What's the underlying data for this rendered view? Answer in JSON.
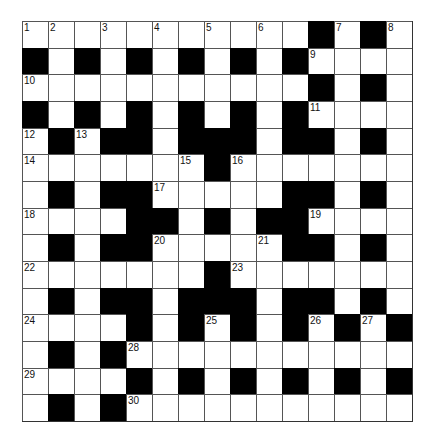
{
  "puzzle": {
    "rows": 15,
    "cols": 15,
    "colors": {
      "block": "#000000",
      "open": "#ffffff",
      "line": "#555555"
    },
    "layout": [
      ".....,.....B.B.",
      "B.B.B.B.B.B....",
      "...........B.B.",
      "B.B.B.B.B.B....",
      ".B.BB.BBB.BB.B.",
      ".......B.......",
      ".B.BB.....BB.B.",
      "....BB.B.BB....",
      ".B.BB.....BB.B.",
      ".......B.......",
      ".B.BB.BBB.BB.B.",
      "....B.B.B.B.B.B",
      ".B.B...........",
      "....B.B.B.B.B.B",
      ".B.B..........."
    ],
    "numbers": [
      {
        "r": 0,
        "c": 0,
        "n": "1"
      },
      {
        "r": 0,
        "c": 1,
        "n": "2"
      },
      {
        "r": 0,
        "c": 3,
        "n": "3"
      },
      {
        "r": 0,
        "c": 5,
        "n": "4"
      },
      {
        "r": 0,
        "c": 7,
        "n": "5"
      },
      {
        "r": 0,
        "c": 9,
        "n": "6"
      },
      {
        "r": 0,
        "c": 12,
        "n": "7"
      },
      {
        "r": 0,
        "c": 14,
        "n": "8"
      },
      {
        "r": 1,
        "c": 11,
        "n": "9"
      },
      {
        "r": 2,
        "c": 0,
        "n": "10"
      },
      {
        "r": 3,
        "c": 11,
        "n": "11"
      },
      {
        "r": 4,
        "c": 0,
        "n": "12"
      },
      {
        "r": 4,
        "c": 2,
        "n": "13"
      },
      {
        "r": 5,
        "c": 0,
        "n": "14"
      },
      {
        "r": 5,
        "c": 6,
        "n": "15"
      },
      {
        "r": 5,
        "c": 8,
        "n": "16"
      },
      {
        "r": 6,
        "c": 5,
        "n": "17"
      },
      {
        "r": 7,
        "c": 0,
        "n": "18"
      },
      {
        "r": 7,
        "c": 11,
        "n": "19"
      },
      {
        "r": 8,
        "c": 5,
        "n": "20"
      },
      {
        "r": 8,
        "c": 9,
        "n": "21"
      },
      {
        "r": 9,
        "c": 0,
        "n": "22"
      },
      {
        "r": 9,
        "c": 8,
        "n": "23"
      },
      {
        "r": 11,
        "c": 0,
        "n": "24"
      },
      {
        "r": 11,
        "c": 7,
        "n": "25"
      },
      {
        "r": 11,
        "c": 11,
        "n": "26"
      },
      {
        "r": 11,
        "c": 13,
        "n": "27"
      },
      {
        "r": 12,
        "c": 4,
        "n": "28"
      },
      {
        "r": 13,
        "c": 0,
        "n": "29"
      },
      {
        "r": 14,
        "c": 4,
        "n": "30"
      }
    ]
  }
}
